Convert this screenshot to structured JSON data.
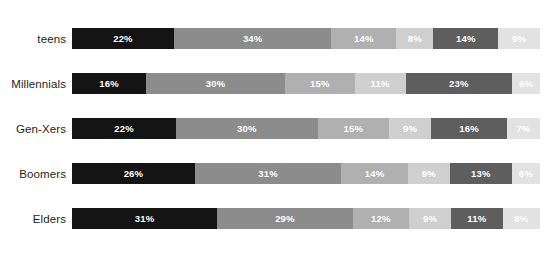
{
  "chart_data": {
    "type": "bar",
    "subtype": "stacked-horizontal-100pct",
    "title": "",
    "xlabel": "",
    "ylabel": "",
    "grid": false,
    "legend": "none",
    "xlim": [
      0,
      100
    ],
    "categories": [
      "teens",
      "Millennials",
      "Gen-Xers",
      "Boomers",
      "Elders"
    ],
    "series": [
      {
        "name": "Segment 1",
        "color": "#141414",
        "values": [
          22,
          16,
          22,
          26,
          31
        ]
      },
      {
        "name": "Segment 2",
        "color": "#8c8c8c",
        "values": [
          34,
          30,
          30,
          31,
          29
        ]
      },
      {
        "name": "Segment 3",
        "color": "#b0b0b0",
        "values": [
          14,
          15,
          15,
          14,
          12
        ]
      },
      {
        "name": "Segment 4",
        "color": "#cfcfcf",
        "values": [
          8,
          11,
          9,
          9,
          9
        ]
      },
      {
        "name": "Segment 5",
        "color": "#5e5e5e",
        "values": [
          14,
          23,
          16,
          13,
          11
        ]
      },
      {
        "name": "Segment 6",
        "color": "#e2e2e2",
        "values": [
          9,
          6,
          7,
          6,
          8
        ]
      }
    ],
    "rows": [
      {
        "label": "teens",
        "segments": [
          {
            "value": 22,
            "label": "22%",
            "color": "#141414"
          },
          {
            "value": 34,
            "label": "34%",
            "color": "#8c8c8c"
          },
          {
            "value": 14,
            "label": "14%",
            "color": "#b0b0b0"
          },
          {
            "value": 8,
            "label": "8%",
            "color": "#cfcfcf"
          },
          {
            "value": 14,
            "label": "14%",
            "color": "#5e5e5e"
          },
          {
            "value": 9,
            "label": "9%",
            "color": "#e2e2e2"
          }
        ]
      },
      {
        "label": "Millennials",
        "segments": [
          {
            "value": 16,
            "label": "16%",
            "color": "#141414"
          },
          {
            "value": 30,
            "label": "30%",
            "color": "#8c8c8c"
          },
          {
            "value": 15,
            "label": "15%",
            "color": "#b0b0b0"
          },
          {
            "value": 11,
            "label": "11%",
            "color": "#cfcfcf"
          },
          {
            "value": 23,
            "label": "23%",
            "color": "#5e5e5e"
          },
          {
            "value": 6,
            "label": "6%",
            "color": "#e2e2e2"
          }
        ]
      },
      {
        "label": "Gen-Xers",
        "segments": [
          {
            "value": 22,
            "label": "22%",
            "color": "#141414"
          },
          {
            "value": 30,
            "label": "30%",
            "color": "#8c8c8c"
          },
          {
            "value": 15,
            "label": "15%",
            "color": "#b0b0b0"
          },
          {
            "value": 9,
            "label": "9%",
            "color": "#cfcfcf"
          },
          {
            "value": 16,
            "label": "16%",
            "color": "#5e5e5e"
          },
          {
            "value": 7,
            "label": "7%",
            "color": "#e2e2e2"
          }
        ]
      },
      {
        "label": "Boomers",
        "segments": [
          {
            "value": 26,
            "label": "26%",
            "color": "#141414"
          },
          {
            "value": 31,
            "label": "31%",
            "color": "#8c8c8c"
          },
          {
            "value": 14,
            "label": "14%",
            "color": "#b0b0b0"
          },
          {
            "value": 9,
            "label": "9%",
            "color": "#cfcfcf"
          },
          {
            "value": 13,
            "label": "13%",
            "color": "#5e5e5e"
          },
          {
            "value": 6,
            "label": "6%",
            "color": "#e2e2e2"
          }
        ]
      },
      {
        "label": "Elders",
        "segments": [
          {
            "value": 31,
            "label": "31%",
            "color": "#141414"
          },
          {
            "value": 29,
            "label": "29%",
            "color": "#8c8c8c"
          },
          {
            "value": 12,
            "label": "12%",
            "color": "#b0b0b0"
          },
          {
            "value": 9,
            "label": "9%",
            "color": "#cfcfcf"
          },
          {
            "value": 11,
            "label": "11%",
            "color": "#5e5e5e"
          },
          {
            "value": 8,
            "label": "8%",
            "color": "#e2e2e2"
          }
        ]
      }
    ]
  }
}
